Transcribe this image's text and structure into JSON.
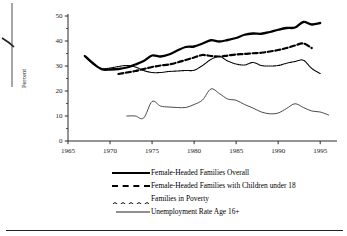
{
  "figure": {
    "background": "#ffffff",
    "ink_color": "#000000"
  },
  "axes": {
    "ylabel": "Percent",
    "y_ticks": [
      "0",
      "10",
      "20",
      "30",
      "40",
      "50"
    ],
    "x_ticks": [
      "1965",
      "1970",
      "1975",
      "1980",
      "1985",
      "1990",
      "1995"
    ]
  },
  "legend": {
    "items": [
      {
        "label": "Female-Headed Families Overall",
        "style": "solid-thick",
        "icon": "line-solid-thick-icon"
      },
      {
        "label": "Female-Headed Families with Children under 18",
        "style": "dashed",
        "icon": "line-dashed-icon"
      },
      {
        "label": "Families in Poverty",
        "style": "wavy-dotted",
        "icon": "line-dotted-icon"
      },
      {
        "label": "Unemployment Rate Age 16+",
        "style": "solid-thin",
        "icon": "line-solid-thin-icon"
      }
    ]
  },
  "chart_data": {
    "type": "line",
    "title": "",
    "xlabel": "",
    "ylabel": "Percent",
    "xlim": [
      1965,
      1997
    ],
    "ylim": [
      0,
      50
    ],
    "grid": false,
    "legend_position": "below",
    "x_ticks": [
      1965,
      1970,
      1975,
      1980,
      1985,
      1990,
      1995
    ],
    "y_ticks": [
      0,
      10,
      20,
      30,
      40,
      50
    ],
    "series": [
      {
        "name": "Female-Headed Families Overall",
        "style": "solid-thick",
        "x": [
          1967,
          1968,
          1969,
          1970,
          1971,
          1972,
          1973,
          1974,
          1975,
          1976,
          1977,
          1978,
          1979,
          1980,
          1981,
          1982,
          1983,
          1984,
          1985,
          1986,
          1987,
          1988,
          1989,
          1990,
          1991,
          1992,
          1993,
          1994,
          1995
        ],
        "values": [
          34.0,
          31.0,
          28.7,
          28.6,
          28.8,
          29.4,
          30.6,
          32.0,
          34.2,
          33.8,
          34.6,
          36.2,
          37.6,
          37.8,
          39.0,
          40.3,
          39.8,
          40.4,
          41.2,
          42.5,
          43.0,
          42.9,
          43.6,
          44.5,
          45.2,
          45.4,
          47.6,
          46.6,
          47.2
        ]
      },
      {
        "name": "Female-Headed Families with Children under 18",
        "style": "dashed",
        "x": [
          1971,
          1972,
          1973,
          1974,
          1975,
          1976,
          1977,
          1978,
          1979,
          1980,
          1981,
          1982,
          1983,
          1984,
          1985,
          1986,
          1987,
          1988,
          1989,
          1990,
          1991,
          1992,
          1993,
          1994
        ],
        "values": [
          26.8,
          27.4,
          28.0,
          28.8,
          29.6,
          30.2,
          30.6,
          31.4,
          32.4,
          33.4,
          34.4,
          34.0,
          33.8,
          34.2,
          34.6,
          34.8,
          35.1,
          35.3,
          35.8,
          36.4,
          37.2,
          38.2,
          39.0,
          37.2
        ]
      },
      {
        "name": "Families in Poverty",
        "style": "wavy-dotted",
        "x": [
          1967,
          1968,
          1969,
          1970,
          1971,
          1972,
          1973,
          1974,
          1975,
          1976,
          1977,
          1978,
          1979,
          1980,
          1981,
          1982,
          1983,
          1984,
          1985,
          1986,
          1987,
          1988,
          1989,
          1990,
          1991,
          1992,
          1993,
          1994,
          1995
        ],
        "values": [
          33.8,
          30.8,
          29.0,
          29.2,
          29.8,
          30.2,
          29.6,
          28.2,
          27.4,
          27.4,
          27.8,
          28.0,
          28.2,
          28.3,
          30.2,
          32.6,
          33.8,
          32.0,
          30.8,
          30.4,
          31.4,
          30.2,
          30.0,
          30.2,
          31.1,
          31.8,
          32.3,
          29.0,
          27.0
        ]
      },
      {
        "name": "Unemployment Rate Age 16+",
        "style": "solid-thin",
        "x": [
          1972,
          1973,
          1974,
          1975,
          1976,
          1977,
          1978,
          1979,
          1980,
          1981,
          1982,
          1983,
          1984,
          1985,
          1986,
          1987,
          1988,
          1989,
          1990,
          1991,
          1992,
          1993,
          1994,
          1995,
          1996
        ],
        "values": [
          10.0,
          10.0,
          9.2,
          15.8,
          14.0,
          13.6,
          13.4,
          13.4,
          14.6,
          16.4,
          20.8,
          19.0,
          16.8,
          16.3,
          14.6,
          13.2,
          11.6,
          10.9,
          11.2,
          13.0,
          14.9,
          13.4,
          12.0,
          11.6,
          10.4
        ]
      }
    ]
  }
}
